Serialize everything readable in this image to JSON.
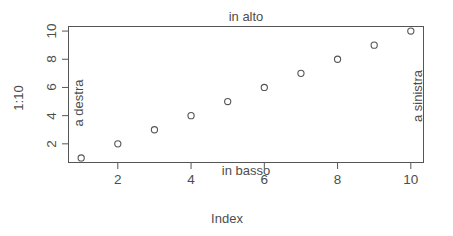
{
  "chart_data": {
    "type": "scatter",
    "title": "",
    "xlabel": "Index",
    "ylabel": "1:10",
    "x": [
      1,
      2,
      3,
      4,
      5,
      6,
      7,
      8,
      9,
      10
    ],
    "y": [
      1,
      2,
      3,
      4,
      5,
      6,
      7,
      8,
      9,
      10
    ],
    "series": [
      {
        "name": "1:10",
        "values": [
          1,
          2,
          3,
          4,
          5,
          6,
          7,
          8,
          9,
          10
        ]
      }
    ],
    "xlim": [
      0.64,
      10.36
    ],
    "ylim": [
      0.64,
      10.36
    ],
    "xticks": [
      2,
      4,
      6,
      8,
      10
    ],
    "yticks": [
      2,
      4,
      6,
      8,
      10
    ],
    "xtick_labels": [
      "2",
      "4",
      "6",
      "8",
      "10"
    ],
    "ytick_labels": [
      "2",
      "4",
      "6",
      "8",
      "10"
    ],
    "grid": false,
    "legend": false,
    "marker": "open-circle",
    "marker_color": "#555555",
    "annotations": [
      {
        "text": "in alto",
        "position": "top"
      },
      {
        "text": "in basso",
        "position": "bottom"
      },
      {
        "text": "a destra",
        "position": "left"
      },
      {
        "text": "a sinistra",
        "position": "right"
      }
    ]
  },
  "axes": {
    "x_title": "Index",
    "y_title": "1:10",
    "x_tick_labels": [
      "2",
      "4",
      "6",
      "8",
      "10"
    ],
    "y_tick_labels": [
      "2",
      "4",
      "6",
      "8",
      "10"
    ]
  },
  "margin_text": {
    "top": "in alto",
    "bottom": "in basso",
    "left": "a destra",
    "right": "a sinistra"
  },
  "colors": {
    "axis": "#555555",
    "text": "#4d4d4d",
    "point": "#555555",
    "background": "#ffffff"
  }
}
